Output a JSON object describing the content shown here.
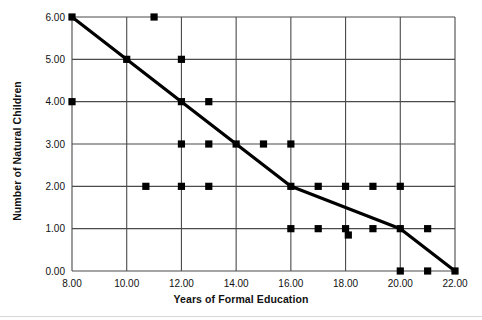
{
  "chart_data": {
    "type": "scatter",
    "title": "",
    "xlabel": "Years of Formal Education",
    "ylabel": "Number of Natural Children",
    "xlim": [
      8,
      22
    ],
    "ylim": [
      0,
      6
    ],
    "xticks": [
      8,
      10,
      12,
      14,
      16,
      18,
      20,
      22
    ],
    "xtick_labels": [
      "8.00",
      "10.00",
      "12.00",
      "14.00",
      "16.00",
      "18.00",
      "20.00",
      "22.00"
    ],
    "yticks": [
      0,
      1,
      2,
      3,
      4,
      5,
      6
    ],
    "ytick_labels": [
      "0.00",
      "1.00",
      "2.00",
      "3.00",
      "4.00",
      "5.00",
      "6.00"
    ],
    "grid": true,
    "legend": "none",
    "marker": "square",
    "marker_color": "#000000",
    "line_color": "#000000",
    "series": [
      {
        "name": "Observations",
        "type": "scatter",
        "points": [
          [
            8,
            6
          ],
          [
            11,
            6
          ],
          [
            10,
            5
          ],
          [
            12,
            5
          ],
          [
            8,
            4
          ],
          [
            12,
            4
          ],
          [
            13,
            4
          ],
          [
            12,
            3
          ],
          [
            13,
            3
          ],
          [
            14,
            3
          ],
          [
            15,
            3
          ],
          [
            16,
            3
          ],
          [
            10.7,
            2
          ],
          [
            12,
            2
          ],
          [
            13,
            2
          ],
          [
            16,
            2
          ],
          [
            17,
            2
          ],
          [
            18,
            2
          ],
          [
            19,
            2
          ],
          [
            20,
            2
          ],
          [
            16,
            1
          ],
          [
            17,
            1
          ],
          [
            18,
            1
          ],
          [
            18.1,
            0.85
          ],
          [
            19,
            1
          ],
          [
            20,
            1
          ],
          [
            21,
            1
          ],
          [
            20,
            0
          ],
          [
            21,
            0
          ],
          [
            22,
            0
          ]
        ]
      },
      {
        "name": "Trend line",
        "type": "line",
        "points": [
          [
            8,
            6
          ],
          [
            12,
            4
          ],
          [
            14,
            3
          ],
          [
            16,
            2
          ],
          [
            20,
            1
          ],
          [
            22,
            0
          ]
        ]
      }
    ]
  },
  "colors": {
    "ink": "#000000",
    "grid": "#4a4a4a",
    "footer_rule": "#d8d8d8"
  }
}
